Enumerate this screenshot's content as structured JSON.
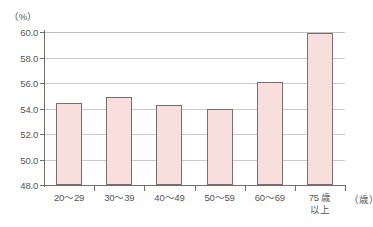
{
  "chart_data": {
    "type": "bar",
    "title": "",
    "xlabel": "（歳）",
    "ylabel": "（%）",
    "categories": [
      "20〜29",
      "30〜39",
      "40〜49",
      "50〜59",
      "60〜69",
      "75 歳\n以上"
    ],
    "values": [
      54.4,
      54.9,
      54.3,
      54.0,
      56.1,
      59.9
    ],
    "ylim": [
      48.0,
      60.0
    ],
    "yticks": [
      "48.0",
      "50.0",
      "52.0",
      "54.0",
      "56.0",
      "58.0",
      "60.0"
    ],
    "ytick_values": [
      48.0,
      50.0,
      52.0,
      54.0,
      56.0,
      58.0,
      60.0
    ],
    "grid": true,
    "legend": false,
    "bar_fill_color": "#f9dede",
    "bar_border_color": "#7d6c6c",
    "gridline_color": "#c9c9c9",
    "axis_color": "#6e6e6e",
    "text_color": "#555555",
    "background_color": "#ffffff"
  }
}
